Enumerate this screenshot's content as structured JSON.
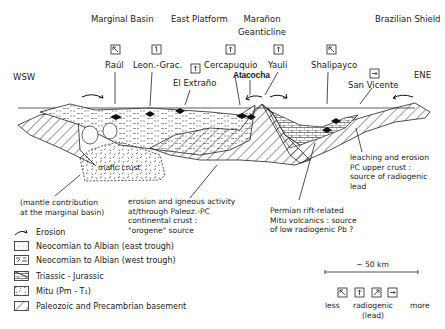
{
  "regions": {
    "marginal_basin": "Marginal Basin",
    "east_platform": "East Platform",
    "maranon_line1": "Marañon",
    "maranon_line2": "Geanticline",
    "brazilian_shield": "Brazilian Shield"
  },
  "directions": {
    "west": "WSW",
    "east": "ENE"
  },
  "localities": [
    {
      "name": "Raúl",
      "icon": "less-radiogenic-icon"
    },
    {
      "name": "Leon.-Grac.",
      "icon": "slightly-radiogenic-icon"
    },
    {
      "name": "El Extraño",
      "icon": "radiogenic-up-arrow-icon"
    },
    {
      "name": "Cercapuquio",
      "icon": "radiogenic-up-arrow-icon"
    },
    {
      "name": "Atacocha",
      "icon": ""
    },
    {
      "name": "Yauli",
      "icon": "radiogenic-up-arrow-icon"
    },
    {
      "name": "Shalipayco",
      "icon": "less-radiogenic-icon"
    },
    {
      "name": "San Vicente",
      "icon": "more-radiogenic-icon"
    }
  ],
  "annotations": {
    "mafic_crust": "mafic crust",
    "mantle": "(mantle contribution\n at the marginal basin)",
    "erosion_igneous": "erosion and igneous activity\nat/through Paleoz.-PC\ncontinental crust :\n\"orogene\" source",
    "permian": "Permian rift-related\nMitu volcanics : source\nof low radiogenic Pb ?",
    "leaching": "leaching and erosion\nPC upper crust :\nsource of radiogenic\nlead"
  },
  "legend": {
    "items": [
      {
        "label": "Erosion",
        "pattern": "erosion-arrow"
      },
      {
        "label": "Neocomian to Albian (east trough)",
        "pattern": "dotted"
      },
      {
        "label": "Neocomian to Albian (west trough)",
        "pattern": "dashed-fill"
      },
      {
        "label": "Triassic - Jurassic",
        "pattern": "brick"
      },
      {
        "label": "Mitu (Pm - T₁)",
        "pattern": "volcanic-dashes"
      },
      {
        "label": "Paleozoic and Precambrian basement",
        "pattern": "diagonal-hatch"
      }
    ]
  },
  "scale": {
    "label": "~ 50 km"
  },
  "radiogenic_scale": {
    "less": "less",
    "middle": "radiogenic",
    "middle2": "(lead)",
    "more": "more"
  }
}
